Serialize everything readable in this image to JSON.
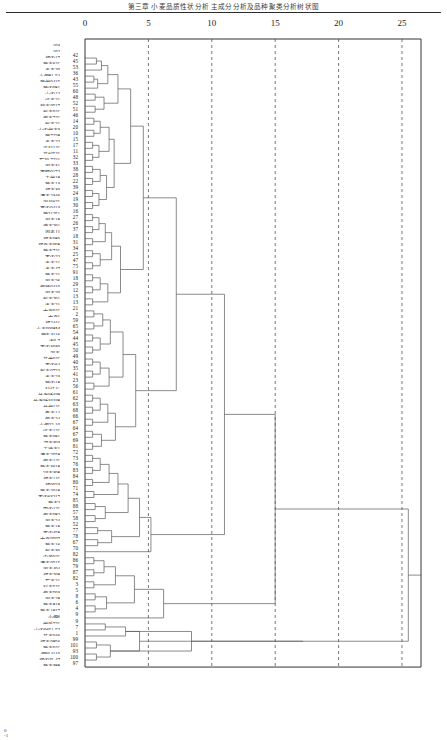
{
  "title": "第三章  小麦品质性状分析  主成分分析及品种聚类分析树状图",
  "axis": {
    "label": "",
    "ticks": [
      0,
      5,
      10,
      15,
      20,
      25
    ],
    "min": 0,
    "max": 26.5
  },
  "footer": "0\n-1",
  "chart_data": {
    "type": "dendrogram",
    "xlabel": "Rescaled Distance Cluster Combine",
    "ylabel": "",
    "xlim": [
      0,
      26.5
    ],
    "xticks": [
      0,
      5,
      10,
      15,
      20,
      25
    ],
    "grid": "vertical-dashed",
    "orientation": "horizontal",
    "leaf_count": 103,
    "leaves": [
      {
        "name": "103",
        "id": ""
      },
      {
        "name": "102",
        "id": ""
      },
      {
        "name": "郑农17",
        "id": "42"
      },
      {
        "name": "豫麦6号",
        "id": "45"
      },
      {
        "name": "洛麦29",
        "id": "53"
      },
      {
        "name": "小偃81-54",
        "id": "36"
      },
      {
        "name": "豫优9415",
        "id": "43"
      },
      {
        "name": "豫农981",
        "id": "55"
      },
      {
        "name": "山农12",
        "id": "60"
      },
      {
        "name": "济麦21",
        "id": "48"
      },
      {
        "name": "鹤麦0517",
        "id": "52"
      },
      {
        "name": "新麦9号",
        "id": "51"
      },
      {
        "name": "偃麦7号",
        "id": "46"
      },
      {
        "name": "新麦21",
        "id": "14"
      },
      {
        "name": "山农优麦3",
        "id": "20"
      },
      {
        "name": "豫7228",
        "id": "10"
      },
      {
        "name": "洛麦22",
        "id": "15"
      },
      {
        "name": "许科1号",
        "id": "17"
      },
      {
        "name": "花培5号",
        "id": "11"
      },
      {
        "name": "石20-7221",
        "id": "32"
      },
      {
        "name": "周麦31",
        "id": "33"
      },
      {
        "name": "西糯0172",
        "id": "38"
      },
      {
        "name": "丰优18",
        "id": "28"
      },
      {
        "name": "豫麦13",
        "id": "22"
      },
      {
        "name": "郑麦30",
        "id": "39"
      },
      {
        "name": "漯麦2346",
        "id": "24"
      },
      {
        "name": "温县6号",
        "id": "19"
      },
      {
        "name": "西农9413",
        "id": "30"
      },
      {
        "name": "豫21251",
        "id": "16"
      },
      {
        "name": "周麦18",
        "id": "27"
      },
      {
        "name": "濮麦201",
        "id": "26"
      },
      {
        "name": "周麦11",
        "id": "37"
      },
      {
        "name": "郑麦989",
        "id": "18"
      },
      {
        "name": "郑育麦998",
        "id": "31"
      },
      {
        "name": "豫麦7号",
        "id": "34"
      },
      {
        "name": "百农22",
        "id": "25"
      },
      {
        "name": "洛麦21",
        "id": "47"
      },
      {
        "name": "洛麦47",
        "id": "75"
      },
      {
        "name": "豫麦21",
        "id": "91"
      },
      {
        "name": "周麦26",
        "id": "18"
      },
      {
        "name": "偃师0410",
        "id": "29"
      },
      {
        "name": "周麦20",
        "id": "12"
      },
      {
        "name": "新麦291",
        "id": "13"
      },
      {
        "name": "洛麦21",
        "id": "13"
      },
      {
        "name": "中育9号",
        "id": "21"
      },
      {
        "name": "中育1",
        "id": "2"
      },
      {
        "name": "郑2441",
        "id": "59"
      },
      {
        "name": "小麦9998M",
        "id": "65"
      },
      {
        "name": "豫麦3116",
        "id": "54"
      },
      {
        "name": "洛9-7",
        "id": "44"
      },
      {
        "name": "百农3039",
        "id": "45"
      },
      {
        "name": "温麦",
        "id": "50"
      },
      {
        "name": "花曲9号",
        "id": "49"
      },
      {
        "name": "百农64",
        "id": "40"
      },
      {
        "name": "新麦9722",
        "id": "35"
      },
      {
        "name": "洛麦23",
        "id": "41"
      },
      {
        "name": "豫农18",
        "id": "23"
      },
      {
        "name": "科技长",
        "id": "56"
      },
      {
        "name": "兰考矮早8",
        "id": "61"
      },
      {
        "name": "兰考矮早早8",
        "id": "62"
      },
      {
        "name": "兰优1号",
        "id": "63"
      },
      {
        "name": "鲁麦14",
        "id": "68"
      },
      {
        "name": "偃麦24",
        "id": "66"
      },
      {
        "name": "小偃22-10",
        "id": "67"
      },
      {
        "name": "济麦1号",
        "id": "64"
      },
      {
        "name": "豫麦981",
        "id": "67"
      },
      {
        "name": "河麦393",
        "id": "69"
      },
      {
        "name": "丰德麦1",
        "id": "81"
      },
      {
        "name": "漯麦2558",
        "id": "72"
      },
      {
        "name": "偃麦1号",
        "id": "73"
      },
      {
        "name": "豫麦3618",
        "id": "76"
      },
      {
        "name": "冠麦308",
        "id": "83"
      },
      {
        "name": "郑麦1号",
        "id": "84"
      },
      {
        "name": "郑0023",
        "id": "80"
      },
      {
        "name": "豫麦2018",
        "id": "71"
      },
      {
        "name": "百农63217",
        "id": "74"
      },
      {
        "name": "豫麦2",
        "id": "85"
      },
      {
        "name": "巴农1号",
        "id": "88"
      },
      {
        "name": "偃麦982",
        "id": "57"
      },
      {
        "name": "周麦24",
        "id": "58"
      },
      {
        "name": "豫麦18",
        "id": "52"
      },
      {
        "name": "百农458",
        "id": "77"
      },
      {
        "name": "中育9507",
        "id": "78"
      },
      {
        "name": "豫麦16",
        "id": "67"
      },
      {
        "name": "新麦39",
        "id": "70"
      },
      {
        "name": "内黄9号",
        "id": "82"
      },
      {
        "name": "漯麦0515",
        "id": "86"
      },
      {
        "name": "周麦404",
        "id": "79"
      },
      {
        "name": "郑麦208",
        "id": "87"
      },
      {
        "name": "石麦21",
        "id": "82"
      },
      {
        "name": "科麦5号",
        "id": "3"
      },
      {
        "name": "偃麦503",
        "id": "5"
      },
      {
        "name": "周麦28",
        "id": "8"
      },
      {
        "name": "豫麦818",
        "id": "6"
      },
      {
        "name": "豫麦1817",
        "id": "4"
      },
      {
        "name": "小偃6",
        "id": "9"
      },
      {
        "name": "优质7号",
        "id": "9"
      },
      {
        "name": "山农0651-52",
        "id": "7"
      },
      {
        "name": "花麦946",
        "id": "1"
      },
      {
        "name": "郑麦0856",
        "id": "99"
      },
      {
        "name": "豫麦9号",
        "id": "101"
      },
      {
        "name": "偃展4110",
        "id": "93"
      },
      {
        "name": "郑农25-47",
        "id": "100"
      },
      {
        "name": "豫麦388",
        "id": "97"
      }
    ]
  }
}
